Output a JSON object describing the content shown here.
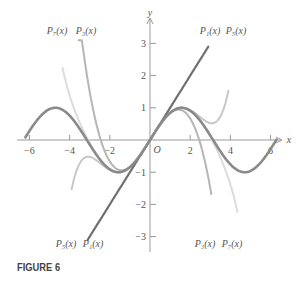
{
  "caption": "FIGURE 6",
  "chart_data": {
    "type": "line",
    "title": "",
    "xlabel": "x",
    "ylabel": "y",
    "origin_label": "O",
    "xlim": [
      -6.5,
      6.5
    ],
    "ylim": [
      -3.3,
      3.3
    ],
    "x_ticks": [
      -6,
      -4,
      -2,
      2,
      4,
      6
    ],
    "y_ticks": [
      -3,
      -2,
      -1,
      1,
      2,
      3
    ],
    "grid": false,
    "series": [
      {
        "name": "sin x",
        "label": "",
        "color": "#8a8a8a",
        "width": 2.6
      },
      {
        "name": "P1(x)",
        "label": "P₁(x)",
        "formula": "x",
        "color": "#6f6f6f",
        "width": 2.2
      },
      {
        "name": "P3(x)",
        "label": "P₃(x)",
        "formula": "x - x^3/6",
        "color": "#b5b5b5",
        "width": 2.0
      },
      {
        "name": "P5(x)",
        "label": "P₅(x)",
        "formula": "x - x^3/6 + x^5/120",
        "color": "#c8c8c8",
        "width": 2.0
      },
      {
        "name": "P7(x)",
        "label": "P₇(x)",
        "formula": "x - x^3/6 + x^5/120 - x^7/5040",
        "color": "#dcdcdc",
        "width": 2.0
      }
    ],
    "annotations": [
      {
        "text": "P₇(x)",
        "position": "top-left"
      },
      {
        "text": "P₃(x)",
        "position": "top-left"
      },
      {
        "text": "P₁(x)",
        "position": "top-right"
      },
      {
        "text": "P₅(x)",
        "position": "top-right"
      },
      {
        "text": "P₅(x)",
        "position": "bottom-left"
      },
      {
        "text": "P₁(x)",
        "position": "bottom-left"
      },
      {
        "text": "P₃(x)",
        "position": "bottom-right"
      },
      {
        "text": "P₇(x)",
        "position": "bottom-right"
      }
    ]
  }
}
